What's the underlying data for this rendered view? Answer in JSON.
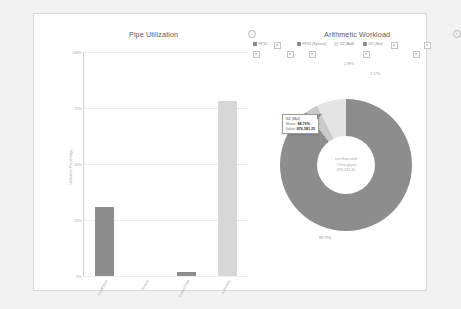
{
  "panels": {
    "pipe": {
      "title": "Pipe Utilization",
      "info_icon": "i"
    },
    "arithmetic": {
      "title": "Arithmetic Workload",
      "info_icon": "i"
    }
  },
  "legend": {
    "items": [
      {
        "label": "FP32",
        "color": "#8d8d8d"
      },
      {
        "label": "FP32 (Special)",
        "color": "#8d8d8d"
      },
      {
        "label": "I32 (Add)",
        "color": "#e0e0e0"
      },
      {
        "label": "I32 (Mul)",
        "color": "#8d8d8d"
      }
    ]
  },
  "tooltip": {
    "series": "I32 (Mul)",
    "share_key": "Share:",
    "share_value": "88.79%",
    "value_key": "Value:",
    "value_value": "876,581.25"
  },
  "donut_center": {
    "line1": "Inst Executed",
    "line2": "/ Throughput",
    "line3": "876,234.30"
  },
  "chart_data": [
    {
      "type": "bar",
      "title": "Pipe Utilization",
      "xlabel": "",
      "ylabel": "Utilization Percentage",
      "categories": [
        "Load/Store",
        "Texture",
        "Control Flow",
        "Arithmetic"
      ],
      "values": [
        31.0,
        0.0,
        2.0,
        78.0
      ],
      "colors": [
        "#8d8d8d",
        "#8d8d8d",
        "#8d8d8d",
        "#d7d7d7"
      ],
      "ylim": [
        0,
        100
      ],
      "yticks": [
        "0%",
        "25%",
        "50%",
        "75%",
        "100%"
      ],
      "ytick_values": [
        0,
        25,
        50,
        75,
        100
      ],
      "grid": true,
      "legend": "none"
    },
    {
      "type": "pie",
      "title": "Arithmetic Workload",
      "labels": [
        "I32 (Mul)",
        "FP32 (Special)",
        "I32 (Add)"
      ],
      "values": [
        88.79,
        2.99,
        7.17
      ],
      "value_labels": [
        "88.79%",
        "2.99%",
        "7.17%"
      ],
      "colors": [
        "#8d8d8d",
        "#c9c9c9",
        "#e3e3e3"
      ],
      "donut": true,
      "legend": "top"
    }
  ]
}
